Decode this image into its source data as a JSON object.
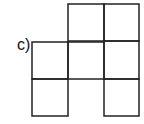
{
  "figure": {
    "label": "c)",
    "grid": {
      "rows": 3,
      "cols": 3,
      "filled_cells": [
        [
          0,
          1
        ],
        [
          0,
          2
        ],
        [
          1,
          0
        ],
        [
          1,
          1
        ],
        [
          1,
          2
        ],
        [
          2,
          0
        ],
        [
          2,
          2
        ]
      ],
      "line_color": "#222222"
    }
  }
}
